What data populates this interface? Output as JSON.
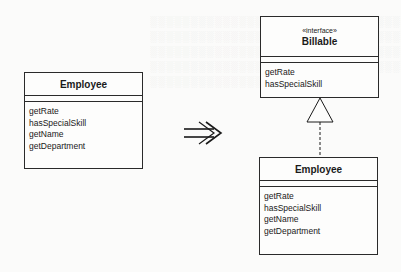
{
  "diagram": {
    "type": "UML class diagram refactoring (Extract Interface)",
    "left_class": {
      "name": "Employee",
      "operations": [
        "getRate",
        "hasSpecialSkill",
        "getName",
        "getDepartment"
      ]
    },
    "transform_arrow": "⇒",
    "interface": {
      "stereotype": "«interface»",
      "name": "Billable",
      "operations": [
        "getRate",
        "hasSpecialSkill"
      ]
    },
    "realization": {
      "from": "Employee",
      "to": "Billable",
      "style": "dashed line with hollow triangle"
    },
    "right_class": {
      "name": "Employee",
      "operations": [
        "getRate",
        "hasSpecialSkill",
        "getName",
        "getDepartment"
      ]
    }
  }
}
